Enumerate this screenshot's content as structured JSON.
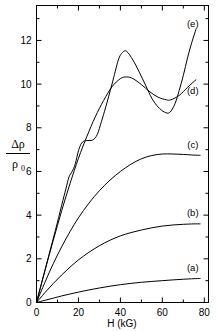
{
  "chart_data": {
    "type": "line",
    "title": "",
    "xlabel": "H (kG)",
    "ylabel": "Δρ/ρ₀",
    "ylabel_numerator": "Δρ",
    "ylabel_denominator_base": "ρ",
    "ylabel_denominator_sub": "0",
    "xlim": [
      0,
      82
    ],
    "ylim": [
      0,
      13.6
    ],
    "xticks": [
      0,
      20,
      40,
      60,
      80
    ],
    "xticklabels": [
      "0",
      "20",
      "40",
      "60",
      "80"
    ],
    "xminorticks": [
      10,
      30,
      50,
      70
    ],
    "yticks": [
      0,
      2,
      4,
      6,
      8,
      10,
      12
    ],
    "yticklabels": [
      "0",
      "2",
      "4",
      "6",
      "8",
      "10",
      "12"
    ],
    "yminorticks": [
      1,
      3,
      5,
      7,
      9,
      11,
      13
    ],
    "grid": false,
    "legend_position": "inline-right-labels",
    "series": [
      {
        "name": "(a)",
        "label": "(a)",
        "label_x": 74.5,
        "label_y": 1.62,
        "x": [
          0,
          4,
          8,
          12,
          16,
          20,
          25,
          30,
          35,
          40,
          45,
          50,
          55,
          60,
          65,
          70,
          75,
          78
        ],
        "y": [
          0,
          0.1,
          0.2,
          0.3,
          0.39,
          0.475,
          0.575,
          0.665,
          0.745,
          0.815,
          0.875,
          0.925,
          0.965,
          1.0,
          1.035,
          1.065,
          1.09,
          1.1
        ]
      },
      {
        "name": "(b)",
        "label": "(b)",
        "label_x": 74.5,
        "label_y": 4.12,
        "x": [
          0,
          4,
          8,
          12,
          16,
          20,
          25,
          30,
          35,
          40,
          45,
          50,
          55,
          60,
          65,
          70,
          75,
          78
        ],
        "y": [
          0,
          0.45,
          0.87,
          1.26,
          1.62,
          1.95,
          2.3,
          2.6,
          2.85,
          3.05,
          3.2,
          3.32,
          3.42,
          3.5,
          3.55,
          3.58,
          3.6,
          3.6
        ]
      },
      {
        "name": "(c)",
        "label": "(c)",
        "label_x": 74.5,
        "label_y": 7.25,
        "x": [
          0,
          4,
          8,
          12,
          16,
          20,
          25,
          30,
          35,
          40,
          45,
          50,
          55,
          60,
          65,
          70,
          75,
          78
        ],
        "y": [
          0,
          0.92,
          1.78,
          2.55,
          3.25,
          3.88,
          4.55,
          5.12,
          5.6,
          6.0,
          6.33,
          6.58,
          6.73,
          6.8,
          6.8,
          6.78,
          6.75,
          6.74
        ]
      },
      {
        "name": "(d)",
        "label": "(d)",
        "label_x": 74.5,
        "label_y": 9.7,
        "x": [
          0,
          4,
          8,
          12,
          16,
          20,
          24,
          28,
          32,
          36,
          40,
          43,
          46,
          50,
          54,
          58,
          62,
          64,
          68,
          72,
          76
        ],
        "y": [
          0,
          1.45,
          2.85,
          4.2,
          5.45,
          6.6,
          7.6,
          8.5,
          9.25,
          9.88,
          10.25,
          10.33,
          10.25,
          9.98,
          9.65,
          9.4,
          9.28,
          9.28,
          9.48,
          9.85,
          10.2
        ]
      },
      {
        "name": "(e)",
        "label": "(e)",
        "label_x": 74.5,
        "label_y": 12.75,
        "x": [
          0,
          3,
          6,
          9,
          12,
          14,
          15.5,
          17,
          18.5,
          20,
          21.5,
          23,
          25,
          27,
          29,
          31,
          33,
          36,
          39,
          41,
          43,
          46,
          49,
          52,
          55,
          58,
          61,
          63.5,
          66,
          68,
          70,
          72,
          74,
          76
        ],
        "y": [
          0,
          1.1,
          2.2,
          3.3,
          4.45,
          5.2,
          5.75,
          6.0,
          6.35,
          6.95,
          7.3,
          7.4,
          7.42,
          7.45,
          7.7,
          8.3,
          8.95,
          10.0,
          11.1,
          11.45,
          11.5,
          11.1,
          10.55,
          9.95,
          9.35,
          8.95,
          8.72,
          8.7,
          9.1,
          9.7,
          10.4,
          11.2,
          11.9,
          12.5
        ]
      }
    ]
  },
  "axes": {
    "x_axis_title": "H (kG)",
    "y_axis_title_numerator": "Δρ",
    "y_axis_title_denominator": "ρ",
    "y_axis_title_denominator_subscript": "0"
  },
  "colors": {
    "curve": "#000000",
    "axis": "#000000",
    "background": "#ffffff"
  }
}
